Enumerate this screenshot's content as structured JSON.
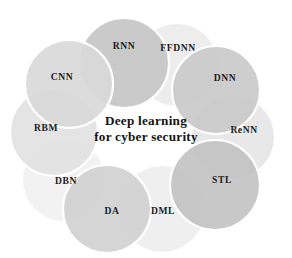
{
  "figure": {
    "title_center_line1": "Deep learning",
    "title_center_line2": "for cyber security",
    "background_color": "#ffffff",
    "stroke_color": "#ffffff"
  },
  "chart_data": {
    "type": "diagram",
    "subtype": "radial-overlapping-circles",
    "title": "Deep learning for cyber security",
    "center_text_lines": [
      "Deep learning",
      "for cyber security"
    ],
    "center_x": 146,
    "center_y": 128,
    "ring_radius": 68,
    "circle_radius": 45,
    "node_count": 10,
    "nodes": [
      {
        "id": "rnn",
        "label": "RNN",
        "cx": 124,
        "cy": 63,
        "r": 45,
        "fill": "#c6c6c6",
        "opacity": 0.92,
        "label_x": 124,
        "label_y": 47,
        "shade": "dark"
      },
      {
        "id": "ffdnn",
        "label": "FFDNN",
        "cx": 177,
        "cy": 65,
        "r": 42,
        "fill": "#ececec",
        "opacity": 0.92,
        "label_x": 178,
        "label_y": 49,
        "shade": "light"
      },
      {
        "id": "dnn",
        "label": "DNN",
        "cx": 216,
        "cy": 90,
        "r": 44,
        "fill": "#c9c9c9",
        "opacity": 0.9,
        "label_x": 225,
        "label_y": 79,
        "shade": "dark"
      },
      {
        "id": "renn",
        "label": "ReNN",
        "cx": 233,
        "cy": 137,
        "r": 42,
        "fill": "#e6e6e6",
        "opacity": 0.9,
        "label_x": 244,
        "label_y": 131,
        "shade": "light"
      },
      {
        "id": "stl",
        "label": "STL",
        "cx": 215,
        "cy": 185,
        "r": 45,
        "fill": "#c2c2c2",
        "opacity": 0.9,
        "label_x": 222,
        "label_y": 181,
        "shade": "dark"
      },
      {
        "id": "dml",
        "label": "DML",
        "cx": 162,
        "cy": 209,
        "r": 44,
        "fill": "#ededed",
        "opacity": 0.9,
        "label_x": 163,
        "label_y": 212,
        "shade": "light"
      },
      {
        "id": "da",
        "label": "DA",
        "cx": 107,
        "cy": 209,
        "r": 44,
        "fill": "#d0d0d0",
        "opacity": 0.9,
        "label_x": 112,
        "label_y": 212,
        "shade": "dark"
      },
      {
        "id": "dbn",
        "label": "DBN",
        "cx": 64,
        "cy": 180,
        "r": 42,
        "fill": "#f1f1f1",
        "opacity": 0.92,
        "label_x": 66,
        "label_y": 182,
        "shade": "light"
      },
      {
        "id": "rbm",
        "label": "RBM",
        "cx": 54,
        "cy": 132,
        "r": 44,
        "fill": "#e2e2e2",
        "opacity": 0.92,
        "label_x": 46,
        "label_y": 129,
        "shade": "light"
      },
      {
        "id": "cnn",
        "label": "CNN",
        "cx": 69,
        "cy": 84,
        "r": 44,
        "fill": "#d9d9d9",
        "opacity": 0.92,
        "label_x": 62,
        "label_y": 78,
        "shade": "mid"
      }
    ],
    "legend": null,
    "grid": false,
    "axes": false
  }
}
